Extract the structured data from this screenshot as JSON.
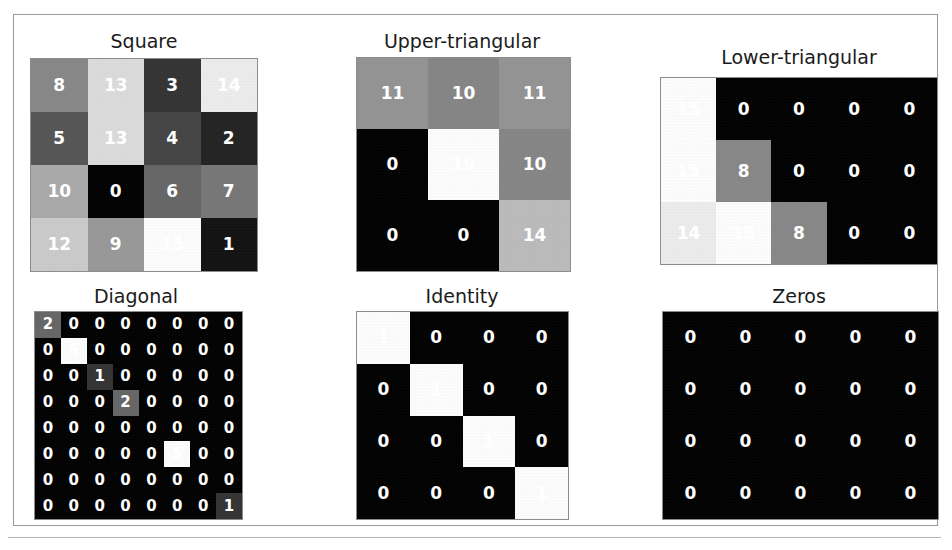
{
  "figure": {
    "background": "#ffffff",
    "frame_color": "#9a9a9a",
    "colormap": "gray",
    "text_color_light": "#ffffff",
    "text_color_dark": "#000000"
  },
  "panels": [
    {
      "key": "square",
      "title": "Square",
      "rows": 4,
      "cols": 4,
      "vmin": 0,
      "vmax": 15,
      "x": 30,
      "y": 29,
      "w": 228,
      "h": 242,
      "grid_x": 30,
      "grid_y": 58,
      "grid_w": 226,
      "grid_h": 212,
      "font_size": 17,
      "values": [
        [
          8,
          13,
          3,
          14
        ],
        [
          5,
          13,
          4,
          2
        ],
        [
          10,
          0,
          6,
          7
        ],
        [
          12,
          9,
          15,
          1
        ]
      ]
    },
    {
      "key": "upper_triangular",
      "title": "Upper-triangular",
      "rows": 3,
      "cols": 3,
      "vmin": 0,
      "vmax": 19,
      "x": 352,
      "y": 29,
      "w": 220,
      "h": 242,
      "grid_x": 356,
      "grid_y": 57,
      "grid_w": 213,
      "grid_h": 213,
      "font_size": 17,
      "values": [
        [
          11,
          10,
          11
        ],
        [
          0,
          19,
          10
        ],
        [
          0,
          0,
          14
        ]
      ]
    },
    {
      "key": "lower_triangular",
      "title": "Lower-triangular",
      "rows": 3,
      "cols": 5,
      "vmin": 0,
      "vmax": 15,
      "x": 660,
      "y": 45,
      "w": 278,
      "h": 226,
      "grid_x": 660,
      "grid_y": 77,
      "grid_w": 276,
      "grid_h": 186,
      "font_size": 17,
      "values": [
        [
          15,
          0,
          0,
          0,
          0
        ],
        [
          15,
          8,
          0,
          0,
          0
        ],
        [
          14,
          15,
          8,
          0,
          0
        ]
      ]
    },
    {
      "key": "diagonal",
      "title": "Diagonal",
      "rows": 8,
      "cols": 8,
      "vmin": 0,
      "vmax": 5,
      "x": 30,
      "y": 284,
      "w": 212,
      "h": 234,
      "grid_x": 34,
      "grid_y": 311,
      "grid_w": 207,
      "grid_h": 207,
      "font_size": 15,
      "values": [
        [
          2,
          0,
          0,
          0,
          0,
          0,
          0,
          0
        ],
        [
          0,
          5,
          0,
          0,
          0,
          0,
          0,
          0
        ],
        [
          0,
          0,
          1,
          0,
          0,
          0,
          0,
          0
        ],
        [
          0,
          0,
          0,
          2,
          0,
          0,
          0,
          0
        ],
        [
          0,
          0,
          0,
          0,
          0,
          0,
          0,
          0
        ],
        [
          0,
          0,
          0,
          0,
          0,
          5,
          0,
          0
        ],
        [
          0,
          0,
          0,
          0,
          0,
          0,
          0,
          0
        ],
        [
          0,
          0,
          0,
          0,
          0,
          0,
          0,
          1
        ]
      ]
    },
    {
      "key": "identity",
      "title": "Identity",
      "rows": 4,
      "cols": 4,
      "vmin": 0,
      "vmax": 1,
      "x": 356,
      "y": 284,
      "w": 212,
      "h": 234,
      "grid_x": 356,
      "grid_y": 311,
      "grid_w": 211,
      "grid_h": 207,
      "font_size": 17,
      "values": [
        [
          1,
          0,
          0,
          0
        ],
        [
          0,
          1,
          0,
          0
        ],
        [
          0,
          0,
          1,
          0
        ],
        [
          0,
          0,
          0,
          1
        ]
      ]
    },
    {
      "key": "zeros",
      "title": "Zeros",
      "rows": 4,
      "cols": 5,
      "vmin": 0,
      "vmax": 0,
      "x": 660,
      "y": 284,
      "w": 278,
      "h": 234,
      "grid_x": 662,
      "grid_y": 311,
      "grid_w": 275,
      "grid_h": 207,
      "font_size": 17,
      "values": [
        [
          0,
          0,
          0,
          0,
          0
        ],
        [
          0,
          0,
          0,
          0,
          0
        ],
        [
          0,
          0,
          0,
          0,
          0
        ],
        [
          0,
          0,
          0,
          0,
          0
        ]
      ]
    }
  ]
}
